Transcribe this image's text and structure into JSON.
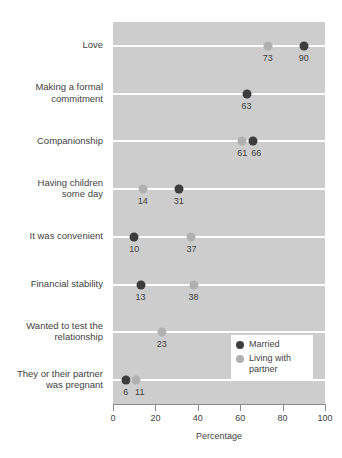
{
  "chart_data": {
    "type": "scatter",
    "title": "",
    "xlabel": "Percentage",
    "ylabel": "",
    "xlim": [
      0,
      100
    ],
    "xticks": [
      0,
      20,
      40,
      60,
      80,
      100
    ],
    "xtick_labels": [
      "0",
      "20",
      "40",
      "60",
      "80",
      "100"
    ],
    "grid": true,
    "legend_position": "bottom-right",
    "categories": [
      "Love",
      "Making a formal commitment",
      "Companionship",
      "Having children some day",
      "It was convenient",
      "Financial stability",
      "Wanted to test the relationship",
      "They or their partner was pregnant"
    ],
    "category_lines": [
      [
        "Love"
      ],
      [
        "Making a formal",
        "commitment"
      ],
      [
        "Companionship"
      ],
      [
        "Having children",
        "some day"
      ],
      [
        "It was convenient"
      ],
      [
        "Financial stability"
      ],
      [
        "Wanted to test the",
        "relationship"
      ],
      [
        "They or their partner",
        "was pregnant"
      ]
    ],
    "series": [
      {
        "name": "Married",
        "color": "#3d3d3d",
        "values": [
          90,
          63,
          66,
          31,
          10,
          13,
          null,
          6
        ]
      },
      {
        "name": "Living with partner",
        "color": "#b0b0b0",
        "values": [
          73,
          null,
          61,
          14,
          37,
          38,
          23,
          11
        ]
      }
    ]
  },
  "legend": {
    "entries": [
      {
        "label": "Married",
        "color": "#3d3d3d"
      },
      {
        "label": "Living with partner",
        "color": "#b0b0b0"
      }
    ]
  },
  "colors": {
    "plot_background": "#cdcdcd",
    "gridline": "#ffffff",
    "axis": "#8a8a8a",
    "text": "#3f3f3f",
    "married": "#3d3d3d",
    "cohab": "#b0b0b0",
    "legend_background": "#ffffff"
  }
}
